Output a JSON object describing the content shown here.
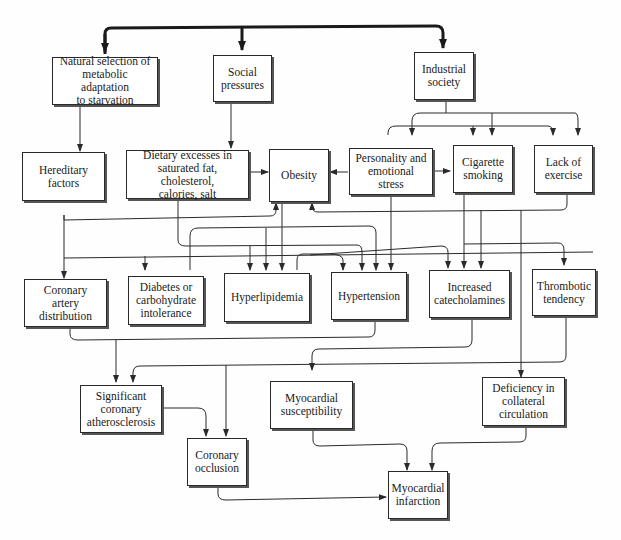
{
  "diagram": {
    "nodes": {
      "natural_selection": "Natural selection of\nmetabolic adaptation\nto starvation",
      "social_pressures": "Social\npressures",
      "industrial_society": "Industrial\nsociety",
      "hereditary_factors": "Hereditary\nfactors",
      "dietary_excesses": "Dietary excesses in\nsaturated fat, cholesterol,\ncalories, salt",
      "obesity": "Obesity",
      "personality_stress": "Personality and\nemotional stress",
      "cigarette_smoking": "Cigarette\nsmoking",
      "lack_of_exercise": "Lack of\nexercise",
      "coronary_artery_distribution": "Coronary artery\ndistribution",
      "diabetes": "Diabetes or\ncarbohydrate\nintolerance",
      "hyperlipidemia": "Hyperlipidemia",
      "hypertension": "Hypertension",
      "increased_catecholamines": "Increased\ncatecholamines",
      "thrombotic_tendency": "Thrombotic\ntendency",
      "significant_atherosclerosis": "Significant\ncoronary\natherosclerosis",
      "myocardial_susceptibility": "Myocardial\nsusceptibility",
      "deficiency_collateral": "Deficiency in\ncollateral\ncirculation",
      "coronary_occlusion": "Coronary\nocclusion",
      "myocardial_infarction": "Myocardial\ninfarction"
    },
    "colors": {
      "line": "#2a2a2a",
      "box_border": "#2a2a2a",
      "background": "#ffffff"
    }
  }
}
